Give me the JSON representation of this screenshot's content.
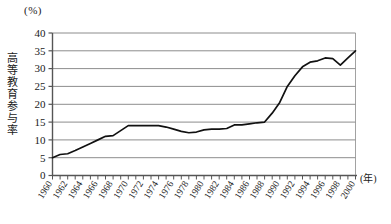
{
  "chart_data": {
    "type": "line",
    "title": "",
    "xlabel": "(年)",
    "ylabel": "高等教育参与率",
    "yunit": "(%)",
    "ylim": [
      0,
      40
    ],
    "ytick_step": 5,
    "yticks": [
      "40",
      "35",
      "30",
      "25",
      "20",
      "15",
      "10",
      "5",
      "0"
    ],
    "xlim": [
      1960,
      2000
    ],
    "xtick_step": 2,
    "grid": "horizontal",
    "legend": "none",
    "line_color": "#111111",
    "grid_color": "#808080",
    "axis_color": "#555555",
    "xticks": [
      "1960",
      "1962",
      "1964",
      "1966",
      "1968",
      "1970",
      "1972",
      "1974",
      "1976",
      "1978",
      "1980",
      "1982",
      "1984",
      "1986",
      "1988",
      "1990",
      "1992",
      "1994",
      "1996",
      "1998",
      "2000"
    ],
    "x": [
      1960,
      1961,
      1962,
      1963,
      1964,
      1965,
      1966,
      1967,
      1968,
      1969,
      1970,
      1971,
      1972,
      1973,
      1974,
      1975,
      1976,
      1977,
      1978,
      1979,
      1980,
      1981,
      1982,
      1983,
      1984,
      1985,
      1986,
      1987,
      1988,
      1989,
      1990,
      1991,
      1992,
      1993,
      1994,
      1995,
      1996,
      1997,
      1998,
      1999,
      2000
    ],
    "values": [
      5.0,
      5.9,
      6.1,
      7.0,
      8.0,
      9.0,
      10.0,
      11.0,
      11.2,
      12.6,
      14.0,
      14.0,
      14.0,
      14.0,
      14.0,
      13.6,
      13.0,
      12.4,
      12.0,
      12.2,
      12.8,
      13.0,
      13.0,
      13.2,
      14.2,
      14.2,
      14.5,
      14.8,
      15.0,
      17.5,
      20.5,
      25.0,
      28.0,
      30.5,
      31.8,
      32.2,
      33.0,
      32.8,
      31.0,
      33.0,
      35.0
    ]
  }
}
